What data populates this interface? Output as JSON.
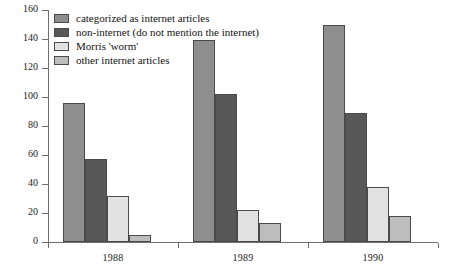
{
  "chart_data": {
    "type": "bar",
    "title": "",
    "subtitle": "",
    "xlabel": "",
    "ylabel": "",
    "categories": [
      "1988",
      "1989",
      "1990"
    ],
    "series": [
      {
        "name": "categorized as internet articles",
        "color": "#8e8e8e",
        "values": [
          96,
          139,
          150
        ]
      },
      {
        "name": "non-internet (do not mention the internet)",
        "color": "#585858",
        "values": [
          57,
          102,
          89
        ]
      },
      {
        "name": "Morris 'worm'",
        "color": "#e2e2e2",
        "values": [
          32,
          22,
          38
        ]
      },
      {
        "name": "other internet articles",
        "color": "#bdbdbd",
        "values": [
          5,
          13,
          18
        ]
      }
    ],
    "ylim": [
      0,
      160
    ],
    "yticks": [
      0,
      20,
      40,
      60,
      80,
      100,
      120,
      140,
      160
    ],
    "ytick_labels": [
      "0",
      "20",
      "40",
      "60",
      "80",
      "100",
      "120",
      "140",
      "160"
    ],
    "grid": false,
    "legend_position": "top-left",
    "annotations": []
  },
  "colors": {
    "axis": "#6f6f6f",
    "bar_outline": "#4a4a4a",
    "text": "#141414",
    "background": "#ffffff"
  }
}
